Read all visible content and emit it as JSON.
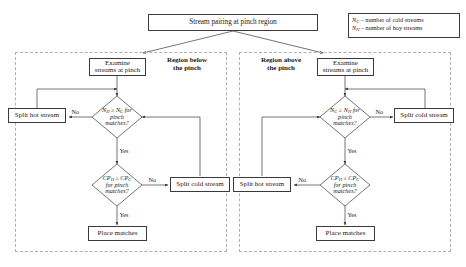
{
  "diagram": {
    "title": "Stream pairing at pinch region",
    "type": "flowchart"
  },
  "legend": {
    "items": [
      {
        "symbol": "N",
        "subscript": "C",
        "dash": "–",
        "text": "number of cold streams"
      },
      {
        "symbol": "N",
        "subscript": "H",
        "dash": "–",
        "text": "number of hoy streams"
      }
    ]
  },
  "regions": [
    {
      "id": "below",
      "label_line1": "Region below",
      "label_line2": "the pinch",
      "nodes": {
        "examine": "Examine\nstreams at pinch",
        "split_side": "Split hot stream",
        "split_lower": "Split cold stream",
        "place": "Place matches"
      },
      "decisions": {
        "d1_line1_left": "N",
        "d1_line1_left_sub": "H",
        "d1_op": "≥",
        "d1_line1_right": "N",
        "d1_line1_right_sub": "C",
        "d1_tail": " for",
        "d1_line2": "pinch",
        "d1_line3": "matches?",
        "d2_line1_left": "CP",
        "d2_line1_left_sub": "H",
        "d2_op": "≥",
        "d2_line1_right": "CP",
        "d2_line1_right_sub": "C",
        "d2_line2": "for pinch",
        "d2_line3": "matches?"
      },
      "edges": {
        "no1": "No",
        "yes1": "Yes",
        "no2": "No",
        "yes2": "Yes"
      }
    },
    {
      "id": "above",
      "label_line1": "Region above",
      "label_line2": "the pinch",
      "nodes": {
        "examine": "Examine\nstreams at pinch",
        "split_side": "Split cold stream",
        "split_lower": "Split hot stream",
        "place": "Place matches"
      },
      "decisions": {
        "d1_line1_left": "N",
        "d1_line1_left_sub": "C",
        "d1_op": "≥",
        "d1_line1_right": "N",
        "d1_line1_right_sub": "H",
        "d1_tail": " for",
        "d1_line2": "pinch",
        "d1_line3": "matches?",
        "d2_line1_left": "CP",
        "d2_line1_left_sub": "H",
        "d2_op": "≤",
        "d2_line1_right": "CP",
        "d2_line1_right_sub": "C",
        "d2_line2": "for pinch",
        "d2_line3": "matches?"
      },
      "edges": {
        "no1": "No",
        "yes1": "Yes",
        "no2": "No",
        "yes2": "Yes"
      }
    }
  ],
  "colors": {
    "stroke": "#3a3a3a",
    "frame": "#b0b0b0",
    "background": "#ffffff",
    "text": "#1a1a1a"
  }
}
